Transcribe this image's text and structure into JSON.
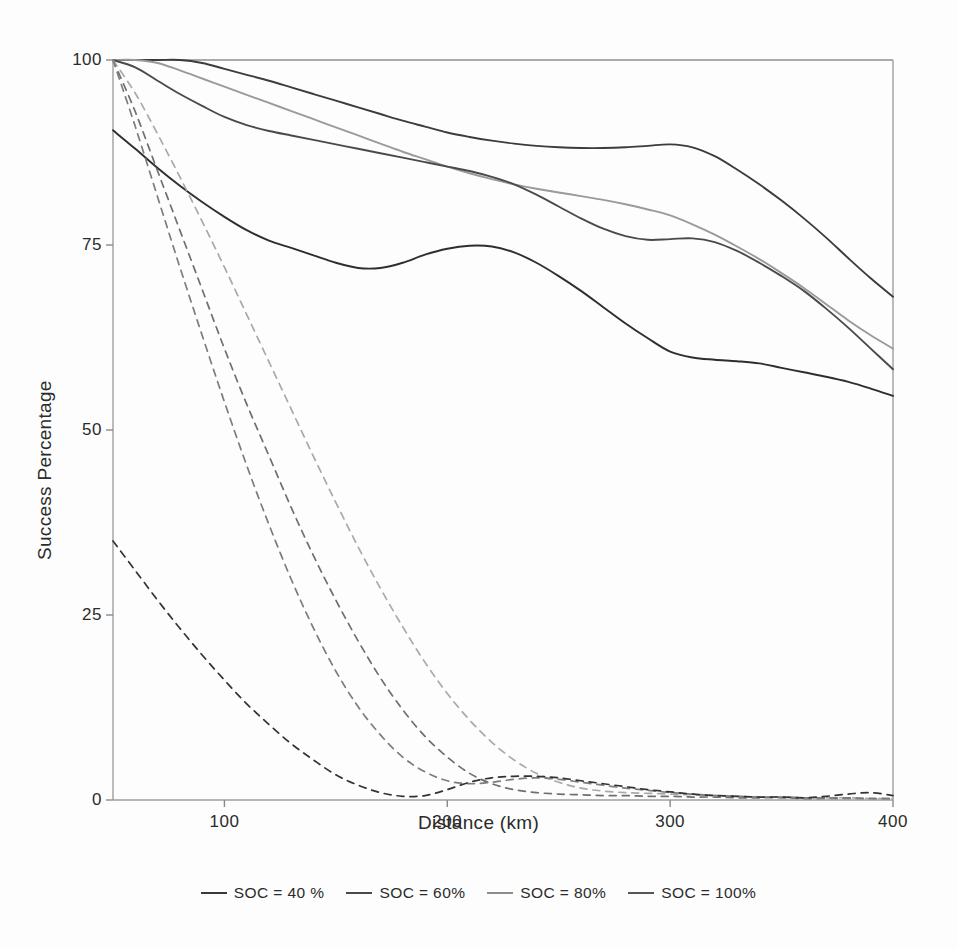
{
  "chart_data": {
    "type": "line",
    "title": "",
    "xlabel": "Distance (km)",
    "ylabel": "Success Percentage",
    "xlim": [
      50,
      400
    ],
    "ylim": [
      0,
      100
    ],
    "xticks": [
      100,
      200,
      300,
      400
    ],
    "yticks": [
      0,
      25,
      50,
      75,
      100
    ],
    "grid": false,
    "legend_position": "bottom",
    "x": [
      50,
      60,
      70,
      80,
      90,
      100,
      110,
      120,
      130,
      140,
      150,
      160,
      170,
      180,
      190,
      200,
      210,
      220,
      230,
      240,
      250,
      260,
      270,
      280,
      290,
      300,
      310,
      320,
      330,
      340,
      350,
      360,
      370,
      380,
      390,
      400
    ],
    "series": [
      {
        "name": "SOC = 100%",
        "style": "solid",
        "color": "#3c3c3c",
        "values": [
          100,
          100,
          100,
          100,
          99.6,
          98.8,
          98.0,
          97.2,
          96.3,
          95.4,
          94.5,
          93.6,
          92.7,
          91.8,
          91.0,
          90.2,
          89.6,
          89.1,
          88.7,
          88.4,
          88.2,
          88.1,
          88.1,
          88.2,
          88.4,
          88.6,
          88.2,
          87.0,
          85.2,
          83.2,
          81.0,
          78.6,
          76.0,
          73.2,
          70.5,
          68.0
        ]
      },
      {
        "name": "SOC = 80%",
        "style": "solid",
        "color": "#9a9a9a",
        "values": [
          100,
          100,
          99.6,
          98.6,
          97.5,
          96.4,
          95.3,
          94.2,
          93.1,
          92.0,
          90.9,
          89.8,
          88.7,
          87.6,
          86.6,
          85.6,
          84.7,
          83.9,
          83.2,
          82.6,
          82.1,
          81.6,
          81.1,
          80.5,
          79.8,
          79.0,
          77.8,
          76.4,
          74.8,
          73.1,
          71.2,
          69.2,
          67.0,
          64.8,
          62.8,
          61.0
        ]
      },
      {
        "name": "SOC = 60%",
        "style": "solid",
        "color": "#4a4a4a",
        "values": [
          100,
          99.0,
          97.2,
          95.4,
          93.8,
          92.3,
          91.2,
          90.4,
          89.8,
          89.2,
          88.6,
          88.0,
          87.4,
          86.8,
          86.2,
          85.6,
          85.0,
          84.2,
          83.2,
          81.8,
          80.2,
          78.6,
          77.2,
          76.2,
          75.7,
          75.8,
          75.9,
          75.4,
          74.2,
          72.6,
          70.8,
          68.8,
          66.4,
          63.8,
          61.0,
          58.2
        ]
      },
      {
        "name": "SOC = 40 %",
        "style": "solid",
        "color": "#2e2e2e",
        "values": [
          90.5,
          88.0,
          85.4,
          83.0,
          80.8,
          78.8,
          77.0,
          75.6,
          74.6,
          73.6,
          72.6,
          71.9,
          71.9,
          72.6,
          73.7,
          74.5,
          74.9,
          74.8,
          74.0,
          72.6,
          70.8,
          68.8,
          66.6,
          64.4,
          62.4,
          60.6,
          59.8,
          59.5,
          59.3,
          59.0,
          58.4,
          57.8,
          57.2,
          56.5,
          55.6,
          54.6
        ]
      },
      {
        "name": "SOC = 100% (failure)",
        "style": "dashed",
        "color": "#6f6f6f",
        "values": [
          100,
          93.0,
          85.0,
          77.0,
          69.0,
          61.0,
          53.5,
          46.5,
          39.5,
          33.0,
          27.0,
          21.5,
          16.5,
          12.2,
          8.6,
          5.8,
          3.6,
          2.2,
          1.4,
          1.0,
          0.8,
          0.7,
          0.6,
          0.6,
          0.5,
          0.5,
          0.4,
          0.4,
          0.3,
          0.3,
          0.3,
          0.2,
          0.2,
          0.2,
          0.2,
          0.2
        ]
      },
      {
        "name": "SOC = 80% (failure)",
        "style": "dashed",
        "color": "#a9a9a9",
        "values": [
          100,
          95.5,
          90.0,
          84.2,
          78.2,
          72.0,
          65.6,
          59.2,
          52.8,
          46.4,
          40.2,
          34.2,
          28.6,
          23.4,
          18.6,
          14.4,
          10.8,
          7.8,
          5.4,
          3.6,
          2.4,
          1.6,
          1.2,
          1.0,
          0.9,
          0.8,
          0.7,
          0.6,
          0.5,
          0.4,
          0.4,
          0.3,
          0.3,
          0.3,
          0.2,
          0.2
        ]
      },
      {
        "name": "SOC = 60% (failure)",
        "style": "dashed",
        "color": "#7d7d7d",
        "values": [
          100,
          91.0,
          81.5,
          72.0,
          62.8,
          53.8,
          45.2,
          37.2,
          29.8,
          23.2,
          17.4,
          12.6,
          8.8,
          5.8,
          3.8,
          2.6,
          2.2,
          2.4,
          2.8,
          3.0,
          2.8,
          2.4,
          2.0,
          1.6,
          1.3,
          1.0,
          0.8,
          0.6,
          0.5,
          0.4,
          0.4,
          0.3,
          0.3,
          0.3,
          0.2,
          0.2
        ]
      },
      {
        "name": "SOC = 40 % (failure)",
        "style": "dashed",
        "color": "#333333",
        "values": [
          35.0,
          31.0,
          27.0,
          23.2,
          19.6,
          16.2,
          13.0,
          10.2,
          7.6,
          5.4,
          3.4,
          2.0,
          1.0,
          0.5,
          0.6,
          1.4,
          2.4,
          3.0,
          3.2,
          3.2,
          3.0,
          2.6,
          2.2,
          1.8,
          1.4,
          1.1,
          0.8,
          0.6,
          0.5,
          0.4,
          0.4,
          0.3,
          0.5,
          0.8,
          1.0,
          0.6
        ]
      }
    ]
  },
  "axes": {
    "yticks": [
      {
        "value": 100,
        "label": "100"
      },
      {
        "value": 75,
        "label": "75"
      },
      {
        "value": 50,
        "label": "50"
      },
      {
        "value": 25,
        "label": "25"
      },
      {
        "value": 0,
        "label": "0"
      }
    ],
    "xticks": [
      {
        "value": 100,
        "label": "100"
      },
      {
        "value": 200,
        "label": "200"
      },
      {
        "value": 300,
        "label": "300"
      },
      {
        "value": 400,
        "label": "400"
      }
    ],
    "xlabel": "Distance (km)",
    "ylabel": "Success Percentage"
  },
  "legend": {
    "items": [
      {
        "label": "SOC = 40 %",
        "color": "#3a3a3a"
      },
      {
        "label": "SOC = 60%",
        "color": "#4a4a4a"
      },
      {
        "label": "SOC = 80%",
        "color": "#8d8d8d"
      },
      {
        "label": "SOC = 100%",
        "color": "#555555"
      }
    ]
  }
}
